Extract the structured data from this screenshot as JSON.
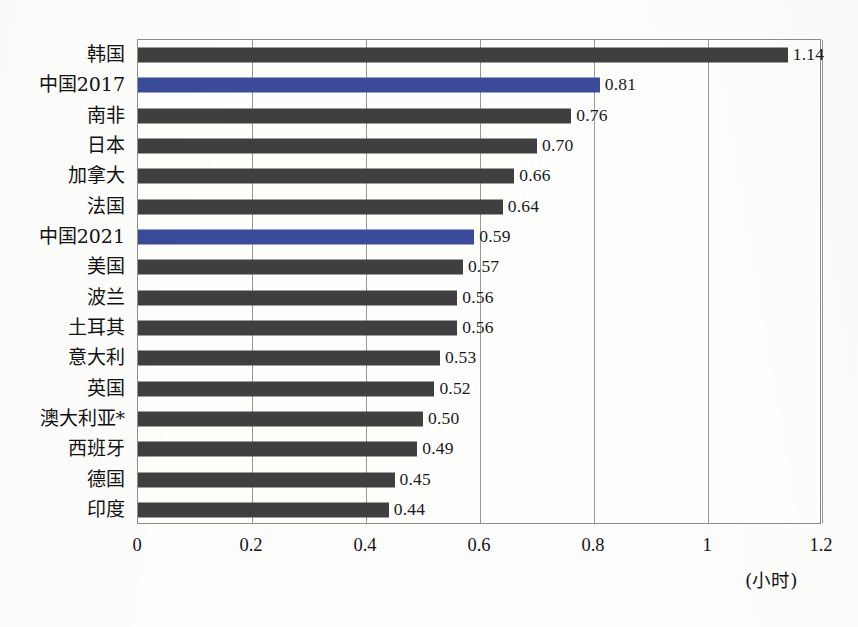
{
  "chart_data": {
    "type": "bar",
    "orientation": "horizontal",
    "title": "",
    "subtitle": "",
    "xlabel": "(小时)",
    "ylabel": "",
    "xlim": [
      0,
      1.2
    ],
    "grid": true,
    "legend": false,
    "legend_position": "none",
    "categories": [
      "韩国",
      "中国2017",
      "南非",
      "日本",
      "加拿大",
      "法国",
      "中国2021",
      "美国",
      "波兰",
      "土耳其",
      "意大利",
      "英国",
      "澳大利亚*",
      "西班牙",
      "德国",
      "印度"
    ],
    "values": [
      1.14,
      0.81,
      0.76,
      0.7,
      0.66,
      0.64,
      0.59,
      0.57,
      0.56,
      0.56,
      0.53,
      0.52,
      0.5,
      0.49,
      0.45,
      0.44
    ],
    "value_labels": [
      "1.14",
      "0.81",
      "0.76",
      "0.70",
      "0.66",
      "0.64",
      "0.59",
      "0.57",
      "0.56",
      "0.56",
      "0.53",
      "0.52",
      "0.50",
      "0.49",
      "0.45",
      "0.44"
    ],
    "bar_colors": [
      "#3f3f3f",
      "#3a4b9b",
      "#3f3f3f",
      "#3f3f3f",
      "#3f3f3f",
      "#3f3f3f",
      "#3a4b9b",
      "#3f3f3f",
      "#3f3f3f",
      "#3f3f3f",
      "#3f3f3f",
      "#3f3f3f",
      "#3f3f3f",
      "#3f3f3f",
      "#3f3f3f",
      "#3f3f3f"
    ],
    "highlight_color": "#3a4b9b",
    "default_color": "#3f3f3f",
    "xticks": [
      0,
      0.2,
      0.4,
      0.6,
      0.8,
      1,
      1.2
    ],
    "xtick_labels": [
      "0",
      "0.2",
      "0.4",
      "0.6",
      "0.8",
      "1",
      "1.2"
    ]
  },
  "axis": {
    "unit_note": "(小时)"
  },
  "colors": {
    "background": "#fdfdfb",
    "plot_background": "#fefefd",
    "grid": "#9a9a92",
    "axis_border": "#8e8e86",
    "bar_gray": "#3f3f3f",
    "bar_blue": "#3a4b9b",
    "text": "#141414"
  }
}
